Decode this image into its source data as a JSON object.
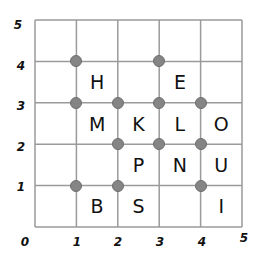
{
  "grid": {
    "min": 0,
    "max": 5,
    "line_color": "#9a9a9a",
    "dot_color": "#858585"
  },
  "axis": {
    "x_labels": [
      "0",
      "1",
      "2",
      "3",
      "4",
      "5"
    ],
    "y_labels": [
      "1",
      "2",
      "3",
      "4",
      "5"
    ]
  },
  "points": [
    {
      "x": 1,
      "y": 4
    },
    {
      "x": 3,
      "y": 4
    },
    {
      "x": 1,
      "y": 3
    },
    {
      "x": 2,
      "y": 3
    },
    {
      "x": 3,
      "y": 3
    },
    {
      "x": 4,
      "y": 3
    },
    {
      "x": 2,
      "y": 2
    },
    {
      "x": 3,
      "y": 2
    },
    {
      "x": 4,
      "y": 2
    },
    {
      "x": 1,
      "y": 1
    },
    {
      "x": 2,
      "y": 1
    },
    {
      "x": 4,
      "y": 1
    }
  ],
  "letters": [
    {
      "char": "H",
      "x": 1,
      "y": 3
    },
    {
      "char": "E",
      "x": 3,
      "y": 3
    },
    {
      "char": "M",
      "x": 1,
      "y": 2
    },
    {
      "char": "K",
      "x": 2,
      "y": 2
    },
    {
      "char": "L",
      "x": 3,
      "y": 2
    },
    {
      "char": "O",
      "x": 4,
      "y": 2
    },
    {
      "char": "P",
      "x": 2,
      "y": 1
    },
    {
      "char": "N",
      "x": 3,
      "y": 1
    },
    {
      "char": "U",
      "x": 4,
      "y": 1
    },
    {
      "char": "B",
      "x": 1,
      "y": 0
    },
    {
      "char": "S",
      "x": 2,
      "y": 0
    },
    {
      "char": "I",
      "x": 4,
      "y": 0
    }
  ]
}
